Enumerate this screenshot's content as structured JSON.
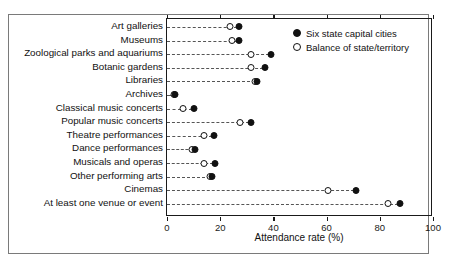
{
  "chart_data": {
    "type": "scatter",
    "title": "",
    "xlabel": "Attendance rate (%)",
    "ylabel": "",
    "xlim": [
      0,
      100
    ],
    "xticks": [
      0,
      20,
      40,
      60,
      80,
      100
    ],
    "grid": false,
    "legend_position": "top-right",
    "categories": [
      "Art galleries",
      "Museums",
      "Zoological parks and aquariums",
      "Botanic gardens",
      "Libraries",
      "Archives",
      "Classical music concerts",
      "Popular music concerts",
      "Theatre performances",
      "Dance performances",
      "Musicals and operas",
      "Other performing arts",
      "Cinemas",
      "At least one venue or event"
    ],
    "series": [
      {
        "name": "Six state capital cities",
        "marker": "filled-circle",
        "color": "#111111",
        "values": [
          27,
          27,
          39,
          37,
          34,
          3,
          10,
          31.5,
          17.5,
          10.5,
          18,
          17,
          71,
          87.5
        ]
      },
      {
        "name": "Balance of state/territory",
        "marker": "open-circle",
        "color": "#111111",
        "values": [
          23.5,
          24.5,
          31.5,
          31.5,
          33,
          2.5,
          6,
          27.5,
          14,
          9.5,
          14,
          16,
          60.5,
          83
        ]
      }
    ]
  },
  "legend": {
    "items": [
      {
        "label": "Six state capital cities",
        "marker": "filled-circle"
      },
      {
        "label": "Balance of state/territory",
        "marker": "open-circle"
      }
    ]
  },
  "axis": {
    "x_title": "Attendance rate (%)",
    "x_tick_labels": [
      "0",
      "20",
      "40",
      "60",
      "80",
      "100"
    ]
  }
}
